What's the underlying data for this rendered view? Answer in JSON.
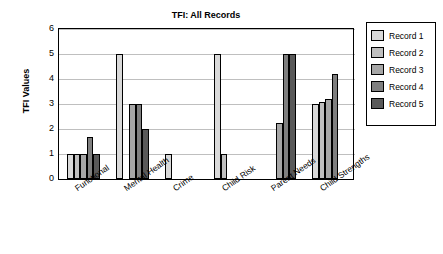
{
  "chart_data": {
    "type": "bar",
    "title": "TFI: All Records",
    "xlabel": "",
    "ylabel": "TFI Values",
    "ylim": [
      0,
      6
    ],
    "yticks": [
      0,
      1,
      2,
      3,
      4,
      5,
      6
    ],
    "grid": true,
    "legend_position": "right",
    "categories": [
      "Functional",
      "Mental Health",
      "Crime",
      "Child Risk",
      "Parent Needs",
      "Child Strengths"
    ],
    "series": [
      {
        "name": "Record 1",
        "values": [
          1,
          5,
          1,
          5,
          0,
          3
        ],
        "color": "#d9d9d9"
      },
      {
        "name": "Record 2",
        "values": [
          1,
          0,
          0,
          1,
          0,
          3.1
        ],
        "color": "#bfbfbf"
      },
      {
        "name": "Record 3",
        "values": [
          1,
          3,
          0,
          0,
          2.25,
          3.2
        ],
        "color": "#a6a6a6"
      },
      {
        "name": "Record 4",
        "values": [
          1.7,
          3,
          0,
          0,
          5,
          4.2
        ],
        "color": "#7f7f7f"
      },
      {
        "name": "Record 5",
        "values": [
          1,
          2,
          0,
          0,
          5,
          0
        ],
        "color": "#595959"
      }
    ]
  }
}
